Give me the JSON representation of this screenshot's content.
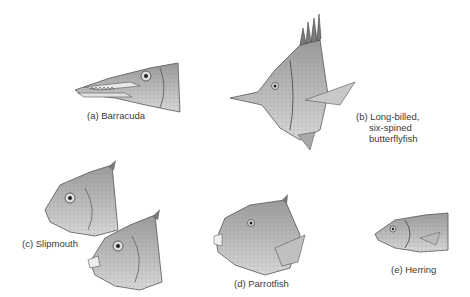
{
  "figure": {
    "panels": [
      {
        "id": "a",
        "label": "(a) Barracuda"
      },
      {
        "id": "b",
        "label_lines": [
          "(b) Long-billed,",
          "six-spined",
          "butterflyfish"
        ]
      },
      {
        "id": "c",
        "label": "(c) Slipmouth"
      },
      {
        "id": "d",
        "label": "(d) Parrotfish"
      },
      {
        "id": "e",
        "label": "(e) Herring"
      }
    ]
  }
}
